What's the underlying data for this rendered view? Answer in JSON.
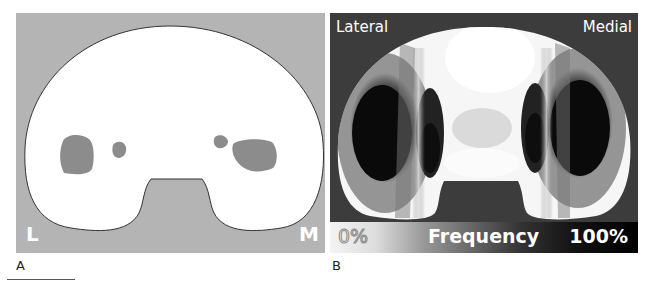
{
  "figure": {
    "panel_a": {
      "letter": "A",
      "corner_left": "L",
      "corner_right": "M",
      "background_color": "#b4b4b4",
      "plateau_color": "#ffffff",
      "contact_patch_color": "#8c8c8c",
      "contact_patches": [
        {
          "side": "lateral",
          "size": "large"
        },
        {
          "side": "lateral",
          "size": "small"
        },
        {
          "side": "medial",
          "size": "small"
        },
        {
          "side": "medial",
          "size": "large"
        }
      ]
    },
    "panel_b": {
      "letter": "B",
      "label_left": "Lateral",
      "label_right": "Medial",
      "background_color": "#3c3c3c",
      "colorbar": {
        "min_label": "0%",
        "title": "Frequency",
        "max_label": "100%",
        "min_color": "#f4f4f4",
        "max_color": "#000000"
      }
    }
  }
}
